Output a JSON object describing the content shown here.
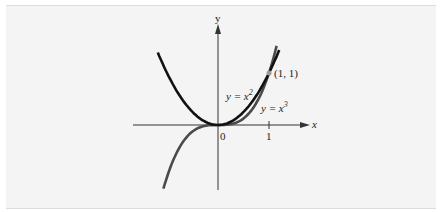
{
  "figure": {
    "axis_x_label": "x",
    "axis_y_label": "y",
    "origin_label": "0",
    "tick_x_label": "1",
    "point_label": "(1, 1)",
    "curves": [
      {
        "name": "y = x^2",
        "label_prefix": "y = x",
        "exponent": "2",
        "color": "#111111"
      },
      {
        "name": "y = x^3",
        "label_prefix": "y = x",
        "exponent": "3",
        "color": "#4a4a4a"
      }
    ],
    "point_color": "#9a9a9a",
    "background": "#f4f4f4"
  },
  "chart_data": {
    "type": "line",
    "title": "",
    "xlabel": "x",
    "ylabel": "y",
    "series": [
      {
        "name": "y = x^2",
        "x": [
          -1.2,
          -1,
          -0.5,
          0,
          0.5,
          1,
          1.2
        ],
        "y": [
          1.44,
          1,
          0.25,
          0,
          0.25,
          1,
          1.44
        ]
      },
      {
        "name": "y = x^3",
        "x": [
          -1.1,
          -1,
          -0.5,
          0,
          0.5,
          1,
          1.15
        ],
        "y": [
          -1.33,
          -1,
          -0.125,
          0,
          0.125,
          1,
          1.52
        ]
      }
    ],
    "annotations": [
      {
        "point": [
          1,
          1
        ],
        "label": "(1, 1)"
      }
    ],
    "x_ticks": [
      0,
      1
    ],
    "grid": false
  }
}
